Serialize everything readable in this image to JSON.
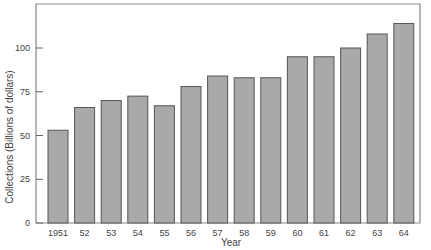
{
  "chart_data": {
    "type": "bar",
    "title": "",
    "xlabel": "Year",
    "ylabel": "Collections (Billions of dollars)",
    "categories": [
      "1951",
      "52",
      "53",
      "54",
      "55",
      "56",
      "57",
      "58",
      "59",
      "60",
      "61",
      "62",
      "63",
      "64"
    ],
    "values": [
      53,
      66,
      70,
      72.5,
      67,
      78,
      84,
      83,
      83,
      95,
      95,
      100,
      108,
      114
    ],
    "yticks": [
      0,
      25,
      50,
      75,
      100
    ],
    "ylim": [
      0,
      125
    ],
    "grid": false,
    "legend": null,
    "colors": {
      "bar_fill": "#a9a9a9",
      "bar_stroke": "#555555",
      "axis": "#888888"
    }
  }
}
